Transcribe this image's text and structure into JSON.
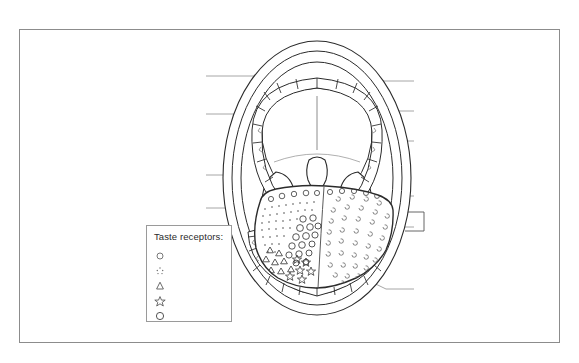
{
  "page": {
    "background_color": "#ffffff",
    "frame_color": "#8c8c8c",
    "ink_color": "#2b2b2b",
    "leader_line_color": "#8f8f8f"
  },
  "legend": {
    "title": "Taste receptors:",
    "items": [
      {
        "symbol": "small-circle",
        "label": ""
      },
      {
        "symbol": "stipple-dots",
        "label": ""
      },
      {
        "symbol": "triangle",
        "label": ""
      },
      {
        "symbol": "star",
        "label": ""
      },
      {
        "symbol": "circle",
        "label": ""
      }
    ]
  },
  "diagram": {
    "name": "open-mouth-anatomy",
    "parts": [
      "lips",
      "upper-teeth-arch",
      "lower-teeth-arch",
      "hard-palate",
      "soft-palate",
      "uvula",
      "palatine-tonsil-left",
      "palatine-tonsil-right",
      "tongue",
      "tongue-midline-sulcus"
    ],
    "labels": [
      {
        "id": "label-line-left-1",
        "text": ""
      },
      {
        "id": "label-line-left-2",
        "text": ""
      },
      {
        "id": "label-line-left-3",
        "text": ""
      },
      {
        "id": "label-line-left-4",
        "text": ""
      },
      {
        "id": "label-line-right-1",
        "text": ""
      },
      {
        "id": "label-line-right-2",
        "text": ""
      },
      {
        "id": "label-line-right-3",
        "text": ""
      },
      {
        "id": "label-line-right-4",
        "text": ""
      },
      {
        "id": "label-line-right-5",
        "text": ""
      },
      {
        "id": "label-line-right-6",
        "text": ""
      }
    ]
  }
}
